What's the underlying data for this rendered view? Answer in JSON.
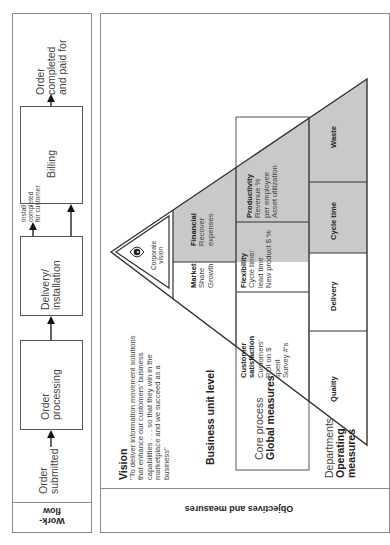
{
  "workflow": {
    "section_label": "Work-\nflow",
    "steps": [
      {
        "label": "Order\nsubmitted"
      },
      {
        "label": "Order\nprocessing"
      },
      {
        "label": "Delivery/\ninstallation"
      },
      {
        "label": "Billing"
      },
      {
        "label": "Order\ncompleted\nand paid for"
      }
    ],
    "branch_label": "Install\ncompleted\nfor customer"
  },
  "objectives": {
    "section_label": "Objectives and measures",
    "vision_title": "Vision",
    "vision_text": "\"To deliver information movement solutions\nthat enhance our customers' business\ncapabilities . . . so that they win in the\nmarketplace and we succeed as a\nbusiness\"",
    "business_unit_label": "Business unit level",
    "core_process_label": "Core process",
    "global_measures_label": "Global measures",
    "departments_label": "Departments",
    "operating_measures_label": "Operating\nmeasures"
  },
  "pyramid": {
    "apex": {
      "label": "Corporate\nvision",
      "icon": "eye-icon"
    },
    "business_unit": [
      {
        "title": "Market",
        "items": "Share\nGrowth",
        "shaded": false
      },
      {
        "title": "Financial",
        "items": "Recover\nexpenses",
        "shaded": true
      }
    ],
    "core_process": [
      {
        "title": "Customer\nsatisfaction",
        "items": "Customers'\nROI on $\nspent\nSurvey #'s",
        "shaded": false
      },
      {
        "title": "Flexibility",
        "items": "Cycle time/\nlead time\nNew product $ %",
        "shaded": false
      },
      {
        "title": "Productivity",
        "items": "Revenue %\nper employee\nAsset utilization",
        "shaded": true
      }
    ],
    "departments": [
      {
        "title": "Quality",
        "shaded": false
      },
      {
        "title": "Delivery",
        "shaded": false
      },
      {
        "title": "Cycle time",
        "shaded": true
      },
      {
        "title": "Waste",
        "shaded": true
      }
    ]
  },
  "colors": {
    "shade": "#c9c9c9",
    "line": "#333333",
    "panel_border": "#8a8a8a"
  }
}
